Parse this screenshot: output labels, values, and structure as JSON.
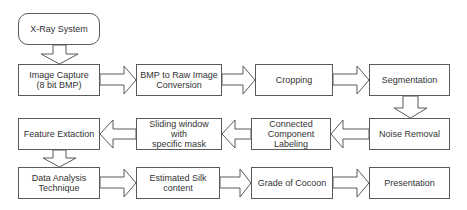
{
  "diagram": {
    "type": "flowchart",
    "nodes": [
      {
        "id": "xray",
        "label": "X-Ray System",
        "shape": "rounded"
      },
      {
        "id": "capture",
        "label": "Image Capture\n(8 bit BMP)"
      },
      {
        "id": "bmp",
        "label": "BMP to Raw Image\nConversion"
      },
      {
        "id": "crop",
        "label": "Cropping"
      },
      {
        "id": "seg",
        "label": "Segmentation"
      },
      {
        "id": "noise",
        "label": "Noise Removal"
      },
      {
        "id": "ccl",
        "label": "Connected\nComponent Labeling"
      },
      {
        "id": "slide",
        "label": "Sliding window with\nspecific mask"
      },
      {
        "id": "feat",
        "label": "Feature Extaction"
      },
      {
        "id": "data",
        "label": "Data Analysis\nTechnique"
      },
      {
        "id": "silk",
        "label": "Estimated Silk\ncontent"
      },
      {
        "id": "grade",
        "label": "Grade of Cocoon"
      },
      {
        "id": "pres",
        "label": "Presentation"
      }
    ],
    "edges": [
      [
        "xray",
        "capture"
      ],
      [
        "capture",
        "bmp"
      ],
      [
        "bmp",
        "crop"
      ],
      [
        "crop",
        "seg"
      ],
      [
        "seg",
        "noise"
      ],
      [
        "noise",
        "ccl"
      ],
      [
        "ccl",
        "slide"
      ],
      [
        "slide",
        "feat"
      ],
      [
        "feat",
        "data"
      ],
      [
        "data",
        "silk"
      ],
      [
        "silk",
        "grade"
      ],
      [
        "grade",
        "pres"
      ]
    ]
  },
  "labels": {
    "xray": "X-Ray System",
    "capture": "Image Capture\n(8 bit BMP)",
    "bmp": "BMP to Raw Image\nConversion",
    "crop": "Cropping",
    "seg": "Segmentation",
    "noise": "Noise Removal",
    "ccl": "Connected\nComponent Labeling",
    "slide": "Sliding window with\nspecific mask",
    "feat": "Feature Extaction",
    "data": "Data Analysis\nTechnique",
    "silk": "Estimated Silk\ncontent",
    "grade": "Grade of Cocoon",
    "pres": "Presentation"
  },
  "colors": {
    "stroke": "#5a5a5a",
    "fill": "#ffffff",
    "text": "#333333"
  }
}
